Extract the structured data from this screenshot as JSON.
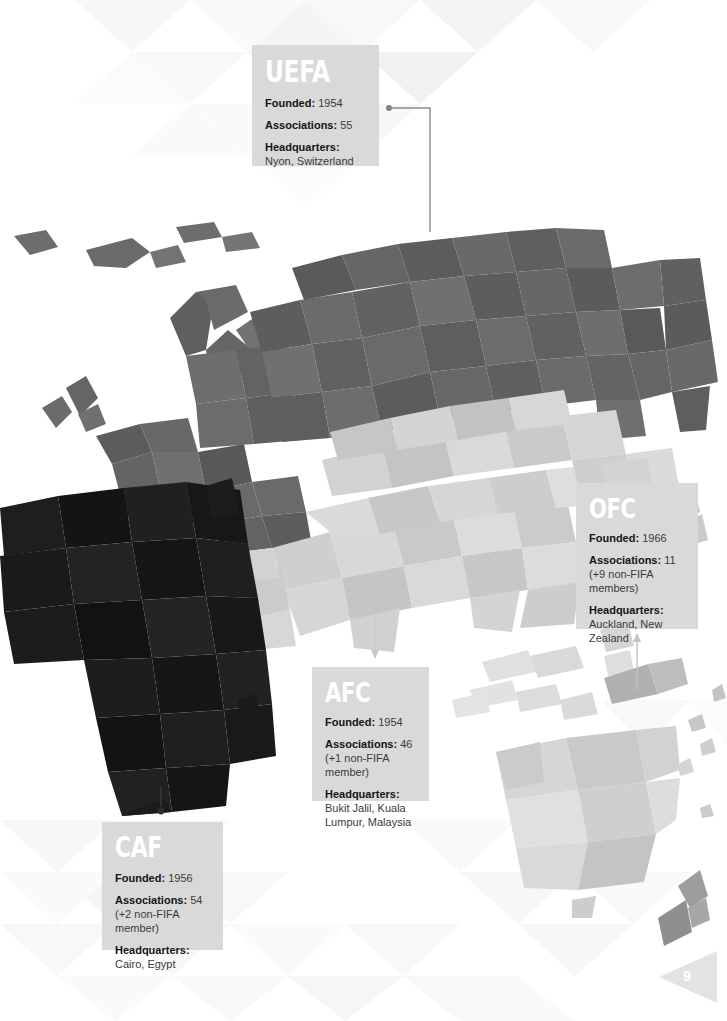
{
  "page": {
    "page_number": "9",
    "background_color": "#ffffff"
  },
  "confederations": [
    {
      "code": "UEFA",
      "founded_label": "Founded:",
      "founded_value": "1954",
      "associations_label": "Associations:",
      "associations_value": "55",
      "headquarters_label": "Headquarters:",
      "headquarters_value": "Nyon, Switzerland",
      "box_color": "#d9d9d9",
      "region_color": "#6f6f6f"
    },
    {
      "code": "OFC",
      "founded_label": "Founded:",
      "founded_value": "1966",
      "associations_label": "Associations:",
      "associations_value": "11 (+9 non-FIFA members)",
      "headquarters_label": "Headquarters:",
      "headquarters_value": "Auckland, New Zealand",
      "box_color": "#d9d9d9",
      "region_color": "#d2d2d2"
    },
    {
      "code": "AFC",
      "founded_label": "Founded:",
      "founded_value": "1954",
      "associations_label": "Associations:",
      "associations_value": "46 (+1 non-FIFA member)",
      "headquarters_label": "Headquarters:",
      "headquarters_value": "Bukit Jalil, Kuala Lumpur, Malaysia",
      "box_color": "#d9d9d9",
      "region_color": "#c4c4c4"
    },
    {
      "code": "CAF",
      "founded_label": "Founded:",
      "founded_value": "1956",
      "associations_label": "Associations:",
      "associations_value": "54 (+2 non-FIFA member)",
      "headquarters_label": "Headquarters:",
      "headquarters_value": "Cairo, Egypt",
      "box_color": "#d9d9d9",
      "region_color": "#1d1d1d"
    }
  ]
}
